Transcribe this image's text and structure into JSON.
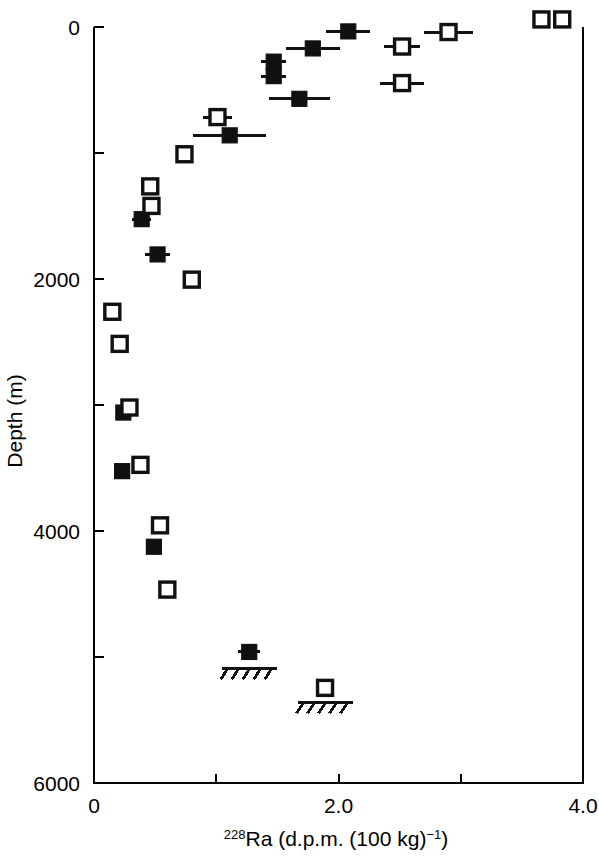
{
  "chart_data": {
    "type": "scatter",
    "title": "",
    "xlabel": "228Ra (d.p.m. (100 kg)-1)",
    "xlabel_parts": {
      "isotope_sup": "228",
      "element": "Ra (d.p.m. (100 kg)",
      "exponent_sup": "−1",
      "tail": ")"
    },
    "ylabel": "Depth (m)",
    "xlim": [
      0,
      4.0
    ],
    "ylim": [
      0,
      6000
    ],
    "y_inverted": true,
    "grid": false,
    "legend_position": "none",
    "x_ticks_major": [
      "0",
      "2.0",
      "4.0"
    ],
    "x_tick_values_major": [
      0,
      2.0,
      4.0
    ],
    "x_tick_values_minor": [
      1.0,
      3.0
    ],
    "y_ticks_major": [
      "0",
      "2000",
      "4000",
      "6000"
    ],
    "y_tick_values_major": [
      0,
      2000,
      4000,
      6000
    ],
    "y_tick_values_minor": [
      1000,
      3000,
      5000
    ],
    "series": [
      {
        "name": "filled-squares",
        "marker": "filled-square",
        "points": [
          {
            "x": 2.08,
            "y": 35,
            "xerr": 0.18
          },
          {
            "x": 1.79,
            "y": 170,
            "xerr": 0.22
          },
          {
            "x": 1.47,
            "y": 275,
            "xerr": 0.1
          },
          {
            "x": 1.47,
            "y": 390,
            "xerr": 0.1
          },
          {
            "x": 1.68,
            "y": 570,
            "xerr": 0.25
          },
          {
            "x": 1.11,
            "y": 860,
            "xerr": 0.3
          },
          {
            "x": 0.39,
            "y": 1525,
            "xerr": 0.08
          },
          {
            "x": 0.52,
            "y": 1805,
            "xerr": 0.1
          },
          {
            "x": 0.24,
            "y": 3060,
            "xerr": 0
          },
          {
            "x": 0.23,
            "y": 3525,
            "xerr": 0
          },
          {
            "x": 0.49,
            "y": 4125,
            "xerr": 0
          },
          {
            "x": 1.27,
            "y": 4960,
            "xerr": 0.09
          }
        ]
      },
      {
        "name": "open-squares",
        "marker": "open-square",
        "points": [
          {
            "x": 3.66,
            "y": -60,
            "xerr": 0
          },
          {
            "x": 3.83,
            "y": -60,
            "xerr": 0
          },
          {
            "x": 2.9,
            "y": 40,
            "xerr": 0.2
          },
          {
            "x": 2.52,
            "y": 155,
            "xerr": 0.15
          },
          {
            "x": 2.52,
            "y": 445,
            "xerr": 0.18
          },
          {
            "x": 1.01,
            "y": 715,
            "xerr": 0.12
          },
          {
            "x": 0.74,
            "y": 1010,
            "xerr": 0
          },
          {
            "x": 0.46,
            "y": 1265,
            "xerr": 0
          },
          {
            "x": 0.47,
            "y": 1420,
            "xerr": 0
          },
          {
            "x": 0.8,
            "y": 2005,
            "xerr": 0
          },
          {
            "x": 0.15,
            "y": 2260,
            "xerr": 0
          },
          {
            "x": 0.21,
            "y": 2515,
            "xerr": 0
          },
          {
            "x": 0.29,
            "y": 3020,
            "xerr": 0
          },
          {
            "x": 0.38,
            "y": 3475,
            "xerr": 0
          },
          {
            "x": 0.54,
            "y": 3955,
            "xerr": 0
          },
          {
            "x": 0.6,
            "y": 4465,
            "xerr": 0
          },
          {
            "x": 1.89,
            "y": 5245,
            "xerr": 0
          }
        ]
      }
    ],
    "annotations": [
      {
        "name": "seafloor-marker-filled-profile",
        "x": 1.27,
        "y": 5090,
        "symbol": "hatched-seafloor",
        "width": 0.45
      },
      {
        "name": "seafloor-marker-open-profile",
        "x": 1.89,
        "y": 5360,
        "symbol": "hatched-seafloor",
        "width": 0.45
      }
    ]
  }
}
